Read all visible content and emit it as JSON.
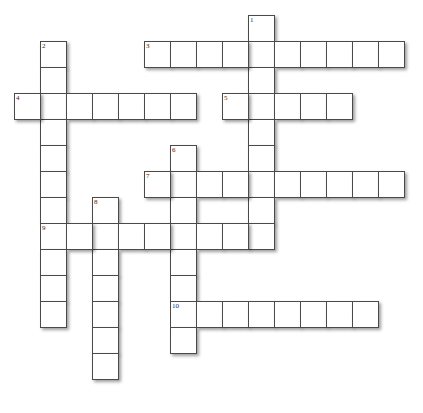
{
  "puzzle": {
    "kind": "crossword-grid",
    "title": "Crossword puzzle grid",
    "background_color": "#ffffff",
    "cell_fill_color": "#ffffff",
    "cell_border_color": "#4a4a4a",
    "number_color": "#2a2a2a",
    "shadow_color": "rgba(0,0,0,0.38)",
    "cell_size_px": 26,
    "origin_x_px": 14,
    "origin_y_px": 15,
    "columns": 16,
    "rows": 15,
    "entry_count": 10,
    "entries": [
      {
        "number": "1",
        "direction": "down",
        "col": 9,
        "row": 0,
        "length": 9,
        "cells": [
          {
            "col": 9,
            "row": 0
          },
          {
            "col": 9,
            "row": 1
          },
          {
            "col": 9,
            "row": 2
          },
          {
            "col": 9,
            "row": 3
          },
          {
            "col": 9,
            "row": 4
          },
          {
            "col": 9,
            "row": 5
          },
          {
            "col": 9,
            "row": 6
          },
          {
            "col": 9,
            "row": 7
          },
          {
            "col": 9,
            "row": 8
          }
        ]
      },
      {
        "number": "2",
        "direction": "down",
        "col": 1,
        "row": 1,
        "length": 11,
        "cells": [
          {
            "col": 1,
            "row": 1
          },
          {
            "col": 1,
            "row": 2
          },
          {
            "col": 1,
            "row": 3
          },
          {
            "col": 1,
            "row": 4
          },
          {
            "col": 1,
            "row": 5
          },
          {
            "col": 1,
            "row": 6
          },
          {
            "col": 1,
            "row": 7
          },
          {
            "col": 1,
            "row": 8
          },
          {
            "col": 1,
            "row": 9
          },
          {
            "col": 1,
            "row": 10
          },
          {
            "col": 1,
            "row": 11
          }
        ]
      },
      {
        "number": "3",
        "direction": "across",
        "col": 5,
        "row": 1,
        "length": 10,
        "cells": [
          {
            "col": 5,
            "row": 1
          },
          {
            "col": 6,
            "row": 1
          },
          {
            "col": 7,
            "row": 1
          },
          {
            "col": 8,
            "row": 1
          },
          {
            "col": 9,
            "row": 1
          },
          {
            "col": 10,
            "row": 1
          },
          {
            "col": 11,
            "row": 1
          },
          {
            "col": 12,
            "row": 1
          },
          {
            "col": 13,
            "row": 1
          },
          {
            "col": 14,
            "row": 1
          }
        ]
      },
      {
        "number": "4",
        "direction": "across",
        "col": 0,
        "row": 3,
        "length": 7,
        "cells": [
          {
            "col": 0,
            "row": 3
          },
          {
            "col": 1,
            "row": 3
          },
          {
            "col": 2,
            "row": 3
          },
          {
            "col": 3,
            "row": 3
          },
          {
            "col": 4,
            "row": 3
          },
          {
            "col": 5,
            "row": 3
          },
          {
            "col": 6,
            "row": 3
          }
        ]
      },
      {
        "number": "5",
        "direction": "across",
        "col": 8,
        "row": 3,
        "length": 5,
        "cells": [
          {
            "col": 8,
            "row": 3
          },
          {
            "col": 9,
            "row": 3
          },
          {
            "col": 10,
            "row": 3
          },
          {
            "col": 11,
            "row": 3
          },
          {
            "col": 12,
            "row": 3
          }
        ]
      },
      {
        "number": "6",
        "direction": "down",
        "col": 6,
        "row": 5,
        "length": 8,
        "cells": [
          {
            "col": 6,
            "row": 5
          },
          {
            "col": 6,
            "row": 6
          },
          {
            "col": 6,
            "row": 7
          },
          {
            "col": 6,
            "row": 8
          },
          {
            "col": 6,
            "row": 9
          },
          {
            "col": 6,
            "row": 10
          },
          {
            "col": 6,
            "row": 11
          },
          {
            "col": 6,
            "row": 12
          }
        ]
      },
      {
        "number": "7",
        "direction": "across",
        "col": 5,
        "row": 6,
        "length": 10,
        "cells": [
          {
            "col": 5,
            "row": 6
          },
          {
            "col": 6,
            "row": 6
          },
          {
            "col": 7,
            "row": 6
          },
          {
            "col": 8,
            "row": 6
          },
          {
            "col": 9,
            "row": 6
          },
          {
            "col": 10,
            "row": 6
          },
          {
            "col": 11,
            "row": 6
          },
          {
            "col": 12,
            "row": 6
          },
          {
            "col": 13,
            "row": 6
          },
          {
            "col": 14,
            "row": 6
          }
        ]
      },
      {
        "number": "8",
        "direction": "down",
        "col": 3,
        "row": 7,
        "length": 7,
        "cells": [
          {
            "col": 3,
            "row": 7
          },
          {
            "col": 3,
            "row": 8
          },
          {
            "col": 3,
            "row": 9
          },
          {
            "col": 3,
            "row": 10
          },
          {
            "col": 3,
            "row": 11
          },
          {
            "col": 3,
            "row": 12
          },
          {
            "col": 3,
            "row": 13
          }
        ]
      },
      {
        "number": "9",
        "direction": "across",
        "col": 1,
        "row": 8,
        "length": 8,
        "cells": [
          {
            "col": 1,
            "row": 8
          },
          {
            "col": 2,
            "row": 8
          },
          {
            "col": 3,
            "row": 8
          },
          {
            "col": 4,
            "row": 8
          },
          {
            "col": 5,
            "row": 8
          },
          {
            "col": 6,
            "row": 8
          },
          {
            "col": 7,
            "row": 8
          },
          {
            "col": 8,
            "row": 8
          }
        ]
      },
      {
        "number": "10",
        "direction": "across",
        "col": 6,
        "row": 11,
        "length": 8,
        "cells": [
          {
            "col": 6,
            "row": 11
          },
          {
            "col": 7,
            "row": 11
          },
          {
            "col": 8,
            "row": 11
          },
          {
            "col": 9,
            "row": 11
          },
          {
            "col": 10,
            "row": 11
          },
          {
            "col": 11,
            "row": 11
          },
          {
            "col": 12,
            "row": 11
          },
          {
            "col": 13,
            "row": 11
          }
        ]
      }
    ]
  }
}
